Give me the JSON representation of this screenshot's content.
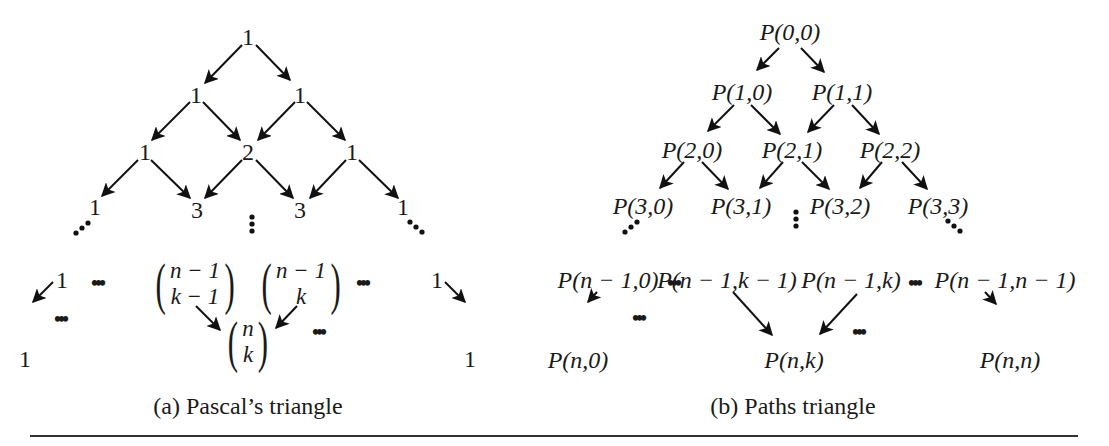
{
  "figure": {
    "panels": [
      {
        "id": "a",
        "caption": "(a)  Pascal’s triangle",
        "rows": [
          [
            "1"
          ],
          [
            "1",
            "1"
          ],
          [
            "1",
            "2",
            "1"
          ],
          [
            "1",
            "3",
            "3",
            "1"
          ]
        ],
        "row_n_minus_1": {
          "left": "1",
          "binom_left": {
            "top": "n − 1",
            "bottom": "k − 1"
          },
          "binom_right": {
            "top": "n − 1",
            "bottom": "k"
          },
          "right": "1"
        },
        "row_n": {
          "left": "1",
          "binom_center": {
            "top": "n",
            "bottom": "k"
          },
          "right": "1"
        },
        "ellipsis": "•••"
      },
      {
        "id": "b",
        "caption": "(b)  Paths triangle",
        "rows": [
          [
            "P(0,0)"
          ],
          [
            "P(1,0)",
            "P(1,1)"
          ],
          [
            "P(2,0)",
            "P(2,1)",
            "P(2,2)"
          ],
          [
            "P(3,0)",
            "P(3,1)",
            "P(3,2)",
            "P(3,3)"
          ]
        ],
        "row_n_minus_1": [
          "P(n − 1,0)",
          "P(n − 1,k − 1)",
          "P(n − 1,k)",
          "P(n − 1,n − 1)"
        ],
        "row_n": [
          "P(n,0)",
          "P(n,k)",
          "P(n,n)"
        ],
        "ellipsis": "•••"
      }
    ]
  }
}
